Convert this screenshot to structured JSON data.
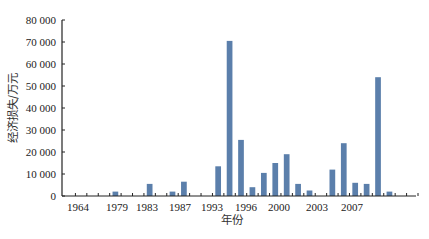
{
  "chart_data": {
    "type": "bar",
    "title": "",
    "xlabel": "年份",
    "ylabel": "经济损失/万元",
    "ylim": [
      0,
      80000
    ],
    "yticks": [
      0,
      10000,
      20000,
      30000,
      40000,
      50000,
      60000,
      70000,
      80000
    ],
    "ytick_labels": [
      "0",
      "10 000",
      "20 000",
      "30 000",
      "40 000",
      "50 000",
      "60 000",
      "70 000",
      "80 000"
    ],
    "xtick_labels": [
      "1964",
      "1979",
      "1983",
      "1987",
      "1993",
      "1996",
      "2000",
      "2003",
      "2007"
    ],
    "grid": false,
    "legend": null,
    "bar_color": "#5b7fab",
    "categories": [
      "1964",
      "s2",
      "s3",
      "s4",
      "1979",
      "s6",
      "s7",
      "1983",
      "s9",
      "s10",
      "1987",
      "s12",
      "s13",
      "s14",
      "1993",
      "s16",
      "s17",
      "1996",
      "s19",
      "s20",
      "s21",
      "2000",
      "s23",
      "s24",
      "s25",
      "2003",
      "s27",
      "s28",
      "2007",
      "s30",
      "s31"
    ],
    "values": [
      0,
      0,
      0,
      0,
      2000,
      0,
      0,
      5500,
      0,
      2000,
      6500,
      0,
      0,
      13500,
      70500,
      25500,
      4000,
      10500,
      15000,
      19000,
      5500,
      2500,
      0,
      12000,
      24000,
      6000,
      5500,
      54000,
      2000,
      0,
      0
    ]
  },
  "labels": {
    "y_axis_title": "经济损失/万元",
    "x_axis_title": "年份"
  }
}
